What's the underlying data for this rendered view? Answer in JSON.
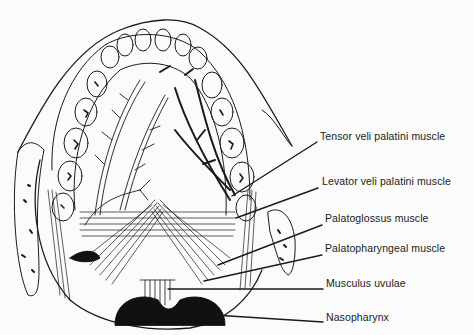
{
  "figure": {
    "colors": {
      "ink": "#1a1a1a",
      "paper": "#fbfbfb"
    }
  },
  "labels": [
    {
      "id": "tensor",
      "text": "Tensor veli palatini muscle",
      "x": 320,
      "y": 136,
      "line": [
        [
          232,
          196
        ],
        [
          317,
          142
        ]
      ]
    },
    {
      "id": "levator",
      "text": "Levator veli palatini muscle",
      "x": 322,
      "y": 181,
      "line": [
        [
          236,
          218
        ],
        [
          318,
          188
        ]
      ]
    },
    {
      "id": "palatoglossus",
      "text": "Palatoglossus muscle",
      "x": 325,
      "y": 218,
      "line": [
        [
          218,
          265
        ],
        [
          322,
          225
        ]
      ]
    },
    {
      "id": "palatopharyngeal",
      "text": "Palatopharyngeal muscle",
      "x": 325,
      "y": 248,
      "line": [
        [
          204,
          281
        ],
        [
          322,
          255
        ]
      ]
    },
    {
      "id": "uvulae",
      "text": "Musculus uvulae",
      "x": 326,
      "y": 283,
      "line": [
        [
          168,
          289
        ],
        [
          323,
          289
        ]
      ]
    },
    {
      "id": "nasopharynx",
      "text": "Nasopharynx",
      "x": 326,
      "y": 317,
      "line": [
        [
          214,
          315
        ],
        [
          323,
          322
        ]
      ]
    }
  ]
}
